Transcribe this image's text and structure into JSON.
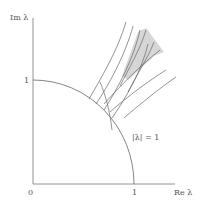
{
  "labels": {
    "y_axis": "Im λ",
    "x_axis": "Re λ",
    "origin": "0",
    "x_tick": "1",
    "y_tick": "1",
    "circle": "|λ| = 1"
  },
  "colors": {
    "axis": "#777777",
    "curve": "#555555",
    "shade": "#d8d8d8"
  }
}
